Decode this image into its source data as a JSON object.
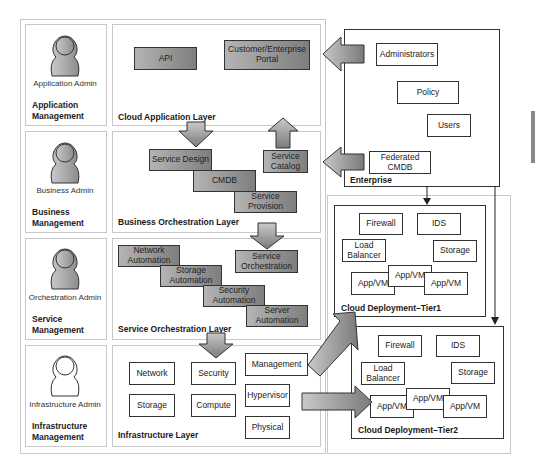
{
  "roles": [
    {
      "admin": "Application Admin",
      "management": [
        "Application",
        "Management"
      ]
    },
    {
      "admin": "Business Admin",
      "management": [
        "Business",
        "Management"
      ]
    },
    {
      "admin": "Orchestration Admin",
      "management": [
        "Service",
        "Management"
      ]
    },
    {
      "admin": "Infrastructure Admin",
      "management": [
        "Infrastructure",
        "Management"
      ]
    }
  ],
  "layers": {
    "cloud_application": {
      "title": "Cloud Application Layer",
      "items": [
        "API",
        "Customer/Enterprise Portal"
      ]
    },
    "business_orchestration": {
      "title": "Business Orchestration Layer",
      "items": [
        "Service Design",
        "CMDB",
        "Service Provision",
        "Service Catalog"
      ]
    },
    "service_orchestration": {
      "title": "Service Orchestration Layer",
      "items": [
        "Network Automation",
        "Storage Automation",
        "Security Automation",
        "Server Automation",
        "Service Orchestration"
      ]
    },
    "infrastructure": {
      "title": "Infrastructure Layer",
      "items": [
        "Network",
        "Security",
        "Storage",
        "Compute",
        "Management",
        "Hypervisor",
        "Physical"
      ]
    }
  },
  "enterprise": {
    "title": "Enterprise",
    "items": [
      "Administrators",
      "Policy",
      "Users",
      "Federated CMDB"
    ]
  },
  "tier1": {
    "title": "Cloud Deployment–Tier1",
    "items": [
      "Firewall",
      "IDS",
      "Load Balancer",
      "Storage",
      "App/VM",
      "App/VM",
      "App/VM"
    ]
  },
  "tier2": {
    "title": "Cloud Deployment–Tier2",
    "items": [
      "Firewall",
      "IDS",
      "Load Balancer",
      "Storage",
      "App/VM",
      "App/VM",
      "App/VM"
    ]
  }
}
